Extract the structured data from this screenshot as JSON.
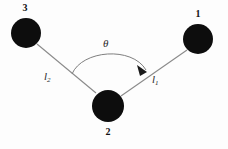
{
  "figure": {
    "width": 228,
    "height": 149,
    "background_color": "#fdfdfd",
    "node_color": "#0d0d0d",
    "line_color": "#8a8a8a",
    "text_color": "#1a1a1a"
  },
  "nodes": [
    {
      "id": "node-3",
      "label": "3",
      "cx": 26,
      "cy": 33,
      "r": 15,
      "label_x": 22,
      "label_y": 3
    },
    {
      "id": "node-1",
      "label": "1",
      "cx": 198,
      "cy": 39,
      "r": 15,
      "label_x": 194,
      "label_y": 9
    },
    {
      "id": "node-2",
      "label": "2",
      "cx": 108,
      "cy": 106,
      "r": 16,
      "label_x": 104,
      "label_y": 127
    }
  ],
  "edges": [
    {
      "id": "edge-l2",
      "label": "l",
      "subscript": "2",
      "from": "node-2",
      "to": "node-3",
      "x1": 96,
      "y1": 93,
      "x2": 37,
      "y2": 44,
      "label_x": 45,
      "label_y": 72
    },
    {
      "id": "edge-l1",
      "label": "l",
      "subscript": "1",
      "from": "node-2",
      "to": "node-1",
      "x1": 121,
      "y1": 96,
      "x2": 187,
      "y2": 50,
      "label_x": 153,
      "label_y": 75
    }
  ],
  "angle": {
    "id": "angle-theta",
    "label": "θ",
    "label_x": 103,
    "label_y": 39,
    "arc_path": "M 72,74 C 82,50 132,46 146,70",
    "arrow_points": "146,70 139,66 141,74"
  }
}
